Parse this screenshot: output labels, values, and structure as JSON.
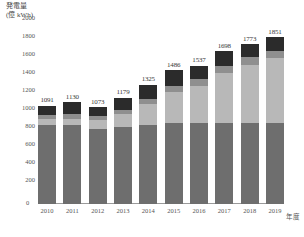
{
  "chart_data": {
    "type": "bar",
    "title": "",
    "ylabel": "発電量\n(億 kWh)",
    "ylabel_line1": "発電量",
    "ylabel_line2": "(億 kWh)",
    "xlabel": "年度",
    "grid": false,
    "stacked": true,
    "legend": "none",
    "ylim": [
      0,
      2000
    ],
    "yticks": [
      2000,
      1800,
      1600,
      1400,
      1200,
      1000,
      800,
      600,
      400,
      200
    ],
    "zero_tick": "0",
    "categories": [
      "2010",
      "2011",
      "2012",
      "2013",
      "2014",
      "2015",
      "2016",
      "2017",
      "2018",
      "2019"
    ],
    "totals": [
      1091,
      1130,
      1073,
      1179,
      1325,
      1486,
      1537,
      1698,
      1773,
      1851
    ],
    "series": [
      {
        "name": "series-1-base",
        "color": "#6e6e6e",
        "values": [
          880,
          880,
          830,
          860,
          880,
          900,
          900,
          900,
          900,
          900
        ]
      },
      {
        "name": "series-2-light",
        "color": "#b8b8b8",
        "values": [
          60,
          70,
          100,
          135,
          230,
          345,
          415,
          560,
          650,
          720
        ]
      },
      {
        "name": "series-3-mid",
        "color": "#8f8f8f",
        "values": [
          45,
          45,
          48,
          54,
          60,
          66,
          72,
          78,
          78,
          81
        ]
      },
      {
        "name": "series-4-top",
        "color": "#2b2b2b",
        "values": [
          106,
          135,
          95,
          130,
          155,
          175,
          150,
          160,
          145,
          150
        ]
      }
    ],
    "colors": {
      "base": "#6e6e6e",
      "light": "#b8b8b8",
      "mid": "#8f8f8f",
      "top": "#2b2b2b",
      "axis": "#9a9a9a",
      "text": "#555555",
      "label_text": "#3a3a3a"
    }
  }
}
